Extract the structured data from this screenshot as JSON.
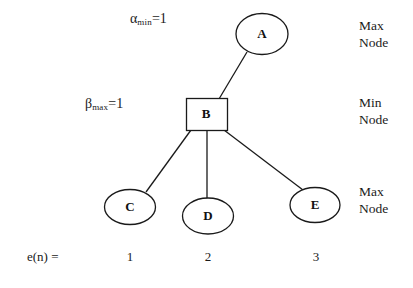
{
  "figure": {
    "type": "minimax-game-tree",
    "background_color": "#ffffff",
    "stroke_color": "#1a1a1a",
    "annotations": {
      "alpha": {
        "symbol": "α",
        "subscript": "min",
        "equals": "=1",
        "full_text": "αmin =1"
      },
      "beta": {
        "symbol": "β",
        "subscript": "max",
        "equals": "=1",
        "full_text": "βmax =1"
      }
    },
    "level_labels": [
      {
        "line1": "Max",
        "line2": "Node"
      },
      {
        "line1": "Min",
        "line2": "Node"
      },
      {
        "line1": "Max",
        "line2": "Node"
      }
    ],
    "eval_row": {
      "label": "e(n) =",
      "values": [
        "1",
        "2",
        "3"
      ]
    },
    "nodes": [
      {
        "id": "A",
        "label": "A",
        "shape": "ellipse",
        "level": "max"
      },
      {
        "id": "B",
        "label": "B",
        "shape": "rectangle",
        "level": "min"
      },
      {
        "id": "C",
        "label": "C",
        "shape": "ellipse",
        "level": "max"
      },
      {
        "id": "D",
        "label": "D",
        "shape": "ellipse",
        "level": "max"
      },
      {
        "id": "E",
        "label": "E",
        "shape": "ellipse",
        "level": "max"
      }
    ],
    "edges": [
      {
        "from": "A",
        "to": "B"
      },
      {
        "from": "B",
        "to": "C"
      },
      {
        "from": "B",
        "to": "D"
      },
      {
        "from": "B",
        "to": "E"
      }
    ]
  }
}
